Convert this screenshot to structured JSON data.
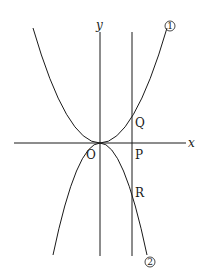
{
  "diagram": {
    "type": "coordinate-graph",
    "axes": {
      "x_label": "x",
      "y_label": "y",
      "origin_label": "O"
    },
    "curves": [
      {
        "id": "1",
        "label": "①",
        "shape": "upward parabola through origin",
        "marker": "1"
      },
      {
        "id": "2",
        "label": "②",
        "shape": "downward parabola through origin",
        "marker": "2"
      }
    ],
    "vertical_line": {
      "description": "vertical line x = t (t > 0)"
    },
    "points": [
      {
        "name": "Q",
        "description": "intersection of vertical line with curve ①"
      },
      {
        "name": "P",
        "description": "intersection of vertical line with x-axis"
      },
      {
        "name": "R",
        "description": "intersection of vertical line with curve ②"
      }
    ],
    "colors": {
      "stroke": "#1a1a1a",
      "background": "#ffffff"
    }
  }
}
